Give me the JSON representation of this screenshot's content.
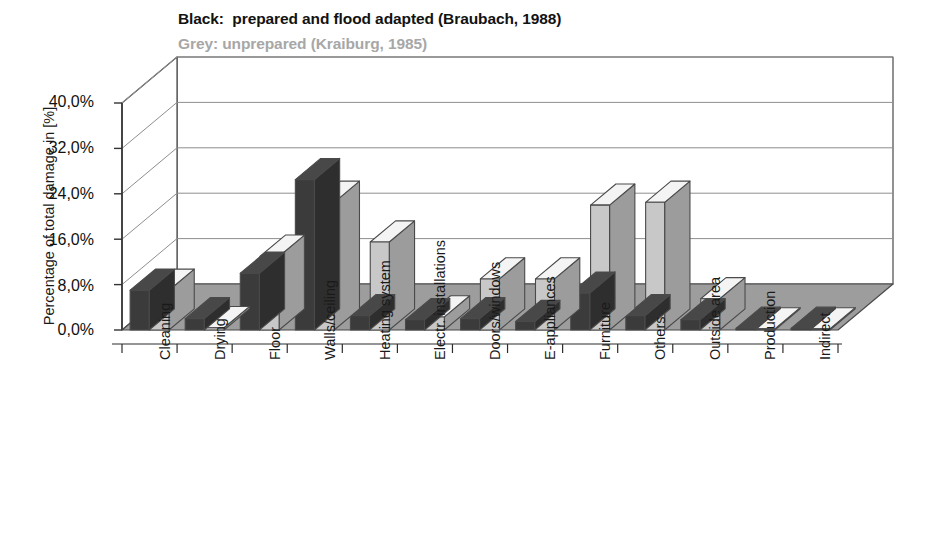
{
  "legend": {
    "line1": "Black:  prepared and flood adapted (Braubach, 1988)",
    "line2": "Grey: unprepared (Kraiburg, 1985)",
    "black_color": "#3b3b3b",
    "grey_color": "#c8c8c8"
  },
  "axis": {
    "ylabel": "Percentage of total damage in [%]",
    "yticks": [
      "0,0%",
      "8,0%",
      "16,0%",
      "24,0%",
      "32,0%",
      "40,0%"
    ],
    "ymin": 0,
    "ymax": 40,
    "ystep": 8,
    "grid": true
  },
  "chart_data": {
    "type": "bar",
    "xlabel": "",
    "ylabel": "Percentage of total damage in [%]",
    "ylim": [
      0,
      40
    ],
    "yticks": [
      0,
      8,
      16,
      24,
      32,
      40
    ],
    "ytick_labels": [
      "0,0%",
      "8,0%",
      "16,0%",
      "24,0%",
      "32,0%",
      "40,0%"
    ],
    "grid": true,
    "legend_position": "above-plot",
    "style": "3d-column",
    "categories": [
      "Cleaning",
      "Drying",
      "Floor",
      "Walls/ceiling",
      "Heating system",
      "Electr. installations",
      "Doors/windows",
      "E-appliances",
      "Furniture",
      "Others",
      "Outside area",
      "Production",
      "Indirect"
    ],
    "series": [
      {
        "name": "Black: prepared and flood adapted (Braubach, 1988)",
        "color": "#3b3b3b",
        "values": [
          7.0,
          2.0,
          10.0,
          26.5,
          2.5,
          1.8,
          2.0,
          1.5,
          6.5,
          2.5,
          1.8,
          0.3,
          0.3
        ]
      },
      {
        "name": "Grey: unprepared (Kraiburg, 1985)",
        "color": "#c8c8c8",
        "values": [
          7.0,
          0.4,
          13.0,
          22.5,
          15.5,
          2.3,
          9.0,
          9.0,
          22.0,
          22.5,
          5.5,
          0.2,
          0.2
        ]
      }
    ]
  }
}
